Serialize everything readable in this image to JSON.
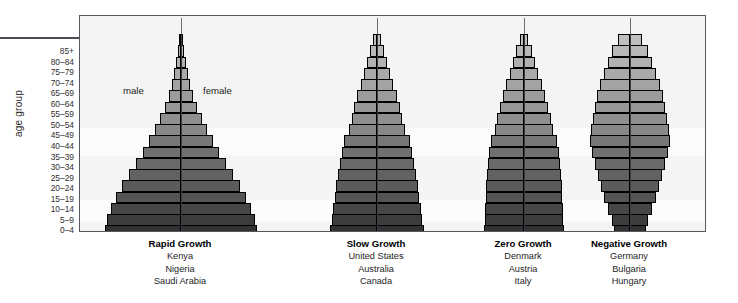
{
  "axis": {
    "title": "age group",
    "tick_labels": [
      "85+",
      "80–84",
      "75–79",
      "70–74",
      "65–69",
      "60–64",
      "55–59",
      "50–54",
      "45–49",
      "40–44",
      "35–39",
      "30–34",
      "25–29",
      "20–24",
      "15–19",
      "10–14",
      "5–9",
      "0–4"
    ]
  },
  "annotations": {
    "male": "male",
    "female": "female"
  },
  "colors": {
    "frame": "#55585e",
    "plot_background": "#f4f4f4",
    "band_background": "#fbfbfb",
    "bar_outline": "#000000",
    "midline": "#3b3b46",
    "text": "#1c1c1c"
  },
  "chart_data": {
    "type": "bar",
    "subtype": "population-pyramid",
    "title": "",
    "xlabel": "",
    "ylabel": "age group",
    "grid": false,
    "legend": [
      "male",
      "female"
    ],
    "legend_position": "inside-top-left",
    "categories": [
      "85+",
      "80–84",
      "75–79",
      "70–74",
      "65–69",
      "60–64",
      "55–59",
      "50–54",
      "45–49",
      "40–44",
      "35–39",
      "30–34",
      "25–29",
      "20–24",
      "15–19",
      "10–14",
      "5–9",
      "0–4"
    ],
    "shade_values": [
      0.1,
      0.14,
      0.18,
      0.22,
      0.26,
      0.3,
      0.34,
      0.38,
      0.42,
      0.52,
      0.56,
      0.6,
      0.64,
      0.68,
      0.72,
      0.8,
      0.86,
      0.92
    ],
    "panels": [
      {
        "name": "Rapid Growth",
        "label": "Rapid Growth",
        "countries": [
          "Kenya",
          "Nigeria",
          "Saudi Arabia"
        ],
        "widths": [
          2,
          4,
          6,
          9,
          12,
          16,
          21,
          27,
          34,
          42,
          50,
          59,
          68,
          77,
          85,
          92,
          97,
          100
        ]
      },
      {
        "name": "Slow Growth",
        "label": "Slow Growth",
        "countries": [
          "United States",
          "Australia",
          "Canada"
        ],
        "widths": [
          9,
          15,
          21,
          28,
          35,
          42,
          48,
          54,
          60,
          70,
          75,
          79,
          83,
          87,
          90,
          93,
          96,
          100
        ]
      },
      {
        "name": "Zero Growth",
        "label": "Zero Growth",
        "countries": [
          "Denmark",
          "Austria",
          "Italy"
        ],
        "widths": [
          11,
          19,
          27,
          36,
          45,
          53,
          60,
          67,
          73,
          83,
          87,
          90,
          92,
          94,
          96,
          97,
          98,
          100
        ]
      },
      {
        "name": "Negative Growth",
        "label": "Negative Growth",
        "countries": [
          "Germany",
          "Bulgaria",
          "Hungary"
        ],
        "widths": [
          30,
          44,
          56,
          66,
          75,
          82,
          88,
          93,
          97,
          100,
          95,
          88,
          80,
          72,
          64,
          54,
          46,
          40
        ]
      }
    ]
  }
}
